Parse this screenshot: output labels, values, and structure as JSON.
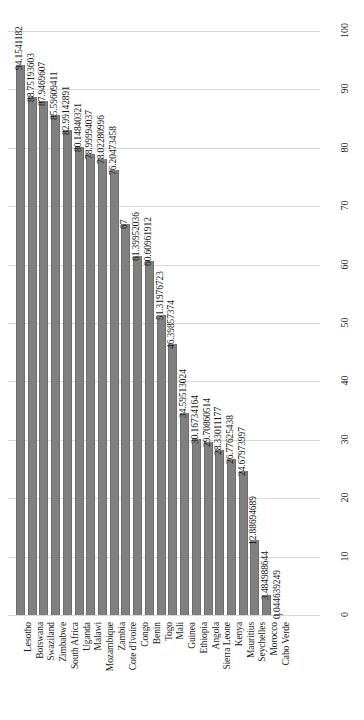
{
  "chart_data": {
    "type": "bar",
    "title": "",
    "subtitle": "",
    "xlabel": "",
    "ylabel": "",
    "ylim": [
      0,
      100
    ],
    "grid": true,
    "legend": false,
    "orientation": "vertical",
    "label_rotation": "90",
    "y_axis_position": "right",
    "yticks": [
      0,
      10,
      20,
      30,
      40,
      50,
      60,
      70,
      80,
      90,
      100
    ],
    "ytick_labels": [
      "0",
      "10",
      "20",
      "30",
      "40",
      "50",
      "60",
      "70",
      "80",
      "90",
      "100"
    ],
    "categories": [
      "Lesotho",
      "Botswana",
      "Swaziland",
      "Zimbabwe",
      "South Africa",
      "Uganda",
      "Malawi",
      "Mozambique",
      "Zambia",
      "Cote d'Ivoire",
      "Congo",
      "Benin",
      "Togo",
      "Mali",
      "Guinea",
      "Ethiopia",
      "Angola",
      "Sierra Leone",
      "Kenya",
      "Mauritius",
      "Seychelles",
      "Morocco",
      "Cabo Verde"
    ],
    "values": [
      94.1541182,
      88.75193603,
      87.9469607,
      85.59609411,
      82.99142891,
      80.14840321,
      78.99994037,
      78.02280996,
      76.20473458,
      67,
      61.39952036,
      60.60961912,
      51.31976723,
      46.39857374,
      34.59513024,
      30.16734164,
      29.70860514,
      28.33011177,
      26.77625438,
      24.67973997,
      12.88694689,
      3.484988644,
      0.044639249
    ],
    "value_labels": [
      "94.1541182",
      "88.75193603",
      "87.9469607",
      "85.59609411",
      "82.99142891",
      "80.14840321",
      "78.99994037",
      "78.02280996",
      "76.20473458",
      "67",
      "61.39952036",
      "60.60961912",
      "51.31976723",
      "46.39857374",
      "34.59513024",
      "30.16734164",
      "29.70860514",
      "28.33011177",
      "26.77625438",
      "24.67973997",
      "12.88694689",
      "3.484988644",
      "0.044639249"
    ],
    "colors": {
      "bar": "#808080",
      "bar_edge": "#6e6e6e",
      "gridline": "#d9d9d9",
      "text": "#1a1a1a",
      "background": "#ffffff"
    }
  }
}
